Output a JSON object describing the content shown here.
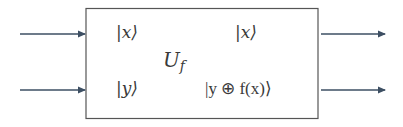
{
  "diagram": {
    "type": "quantum-oracle-block",
    "gate": {
      "name": "U",
      "subscript": "f"
    },
    "inputs": [
      {
        "label": "|x⟩"
      },
      {
        "label": "|y⟩"
      }
    ],
    "outputs": [
      {
        "label": "|x⟩"
      },
      {
        "label": "|y ⊕ f(x)⟩"
      }
    ],
    "colors": {
      "line": "#3d4f63",
      "box_border": "#4a4a4a",
      "text": "#3a3a3a"
    }
  }
}
